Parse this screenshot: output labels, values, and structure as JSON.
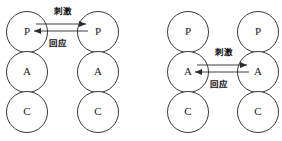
{
  "figure": {
    "background_color": "#ffffff",
    "stroke_color": "#3a3a3a",
    "arrow_color": "#2b2b2b",
    "text_color": "#1a1a1a"
  },
  "diagrams": [
    {
      "id": "complementary-transaction-parent-parent",
      "position": "left",
      "columns": [
        {
          "id": "left-person",
          "states": [
            {
              "code": "P",
              "name": "parent-ego-state"
            },
            {
              "code": "A",
              "name": "adult-ego-state"
            },
            {
              "code": "C",
              "name": "child-ego-state"
            }
          ]
        },
        {
          "id": "right-person",
          "states": [
            {
              "code": "P",
              "name": "parent-ego-state"
            },
            {
              "code": "A",
              "name": "adult-ego-state"
            },
            {
              "code": "C",
              "name": "child-ego-state"
            }
          ]
        }
      ],
      "vectors": [
        {
          "id": "stimulus",
          "label": "刺激",
          "direction": "right",
          "from_state": "P",
          "to_state": "P",
          "row": 0
        },
        {
          "id": "response",
          "label": "回应",
          "direction": "left",
          "from_state": "P",
          "to_state": "P",
          "row": 0
        }
      ]
    },
    {
      "id": "complementary-transaction-adult-adult",
      "position": "right",
      "columns": [
        {
          "id": "left-person",
          "states": [
            {
              "code": "P",
              "name": "parent-ego-state"
            },
            {
              "code": "A",
              "name": "adult-ego-state"
            },
            {
              "code": "C",
              "name": "child-ego-state"
            }
          ]
        },
        {
          "id": "right-person",
          "states": [
            {
              "code": "P",
              "name": "parent-ego-state"
            },
            {
              "code": "A",
              "name": "adult-ego-state"
            },
            {
              "code": "C",
              "name": "child-ego-state"
            }
          ]
        }
      ],
      "vectors": [
        {
          "id": "stimulus",
          "label": "刺激",
          "direction": "right",
          "from_state": "A",
          "to_state": "A",
          "row": 1
        },
        {
          "id": "response",
          "label": "回应",
          "direction": "left",
          "from_state": "A",
          "to_state": "A",
          "row": 1
        }
      ]
    }
  ]
}
